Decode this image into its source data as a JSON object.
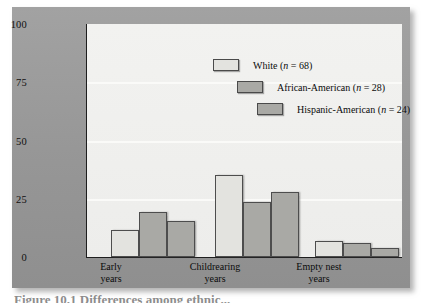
{
  "figure": {
    "panel_color": "#9a9a9a",
    "plot_bg_color": "#f0f0ee",
    "caption_partial": "Figure 10.1  Differences among ethnic..."
  },
  "chart_data": {
    "type": "bar",
    "title": "",
    "xlabel": "",
    "ylabel": "Percentage of individuals married with children for 20 or more years reporting major conflicts",
    "ylim": [
      0,
      100
    ],
    "yticks": [
      0,
      25,
      50,
      75,
      100
    ],
    "ytick_labels": [
      "0",
      "25",
      "50",
      "75",
      "100"
    ],
    "grid": true,
    "grid_axis": "y",
    "legend_position": "upper-center",
    "categories": [
      "Early years",
      "Childrearing years",
      "Empty nest years"
    ],
    "category_lines": [
      [
        "Early",
        "years"
      ],
      [
        "Childrearing",
        "years"
      ],
      [
        "Empty nest",
        "years"
      ]
    ],
    "series": [
      {
        "name": "White (n = 68)",
        "label_main": "White",
        "label_n": "n = 68",
        "color": "#e3e3df",
        "values": [
          11.5,
          35,
          7
        ]
      },
      {
        "name": "African-American (n = 28)",
        "label_main": "African-American",
        "label_n": "n = 28",
        "color": "#a9a9a5",
        "values": [
          19.5,
          23.5,
          6
        ]
      },
      {
        "name": "Hispanic-American (n = 24)",
        "label_main": "Hispanic-American",
        "label_n": "n = 24",
        "color": "#a9a9a5",
        "values": [
          15.5,
          28,
          4
        ]
      }
    ]
  },
  "yaxis": {
    "ticks": [
      "100",
      "75",
      "50",
      "25",
      "0"
    ],
    "title": "Percentage of individuals married with children for 20 or more years reporting major conflicts"
  },
  "legend": {
    "entries": [
      {
        "label_main": "White",
        "paren_open": "(",
        "ital": "n",
        "rest": " = 68)",
        "color": "#e3e3df"
      },
      {
        "label_main": "African-American",
        "paren_open": "(",
        "ital": "n",
        "rest": " = 28)",
        "color": "#a9a9a5"
      },
      {
        "label_main": "Hispanic-American",
        "paren_open": "(",
        "ital": "n",
        "rest": " = 24)",
        "color": "#a9a9a5"
      }
    ]
  },
  "xaxis": {
    "categories": [
      {
        "line1": "Early",
        "line2": "years"
      },
      {
        "line1": "Childrearing",
        "line2": "years"
      },
      {
        "line1": "Empty nest",
        "line2": "years"
      }
    ]
  }
}
